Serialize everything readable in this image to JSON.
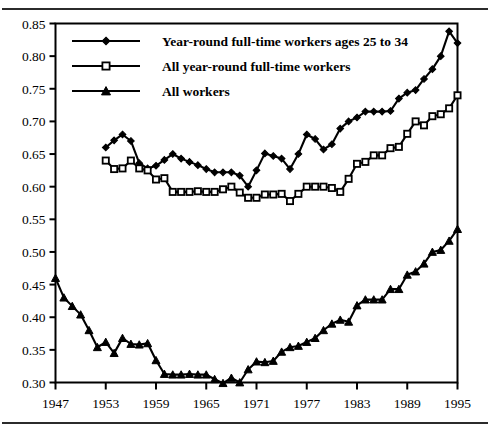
{
  "chart_data": {
    "type": "line",
    "title": "",
    "subtitle": "",
    "xlabel": "",
    "ylabel": "",
    "xlim": [
      1947,
      1995
    ],
    "ylim": [
      0.3,
      0.85
    ],
    "grid": false,
    "legend_position": "top-left-inside",
    "yticks": [
      "0.85",
      "0.80",
      "0.75",
      "0.70",
      "0.65",
      "0.60",
      "0.55",
      "0.50",
      "0.45",
      "0.40",
      "0.35",
      "0.30"
    ],
    "ytick_values": [
      0.85,
      0.8,
      0.75,
      0.7,
      0.65,
      0.6,
      0.55,
      0.5,
      0.45,
      0.4,
      0.35,
      0.3
    ],
    "xticks": [
      "1947",
      "1953",
      "1959",
      "1965",
      "1971",
      "1977",
      "1983",
      "1989",
      "1995"
    ],
    "xtick_values": [
      1947,
      1953,
      1959,
      1965,
      1971,
      1977,
      1983,
      1989,
      1995
    ],
    "series": [
      {
        "name": "Year-round full-time workers ages 25 to 34",
        "marker": "diamond",
        "color": "#000000",
        "x": [
          1953,
          1954,
          1955,
          1956,
          1957,
          1958,
          1959,
          1960,
          1961,
          1962,
          1963,
          1964,
          1965,
          1966,
          1967,
          1968,
          1969,
          1970,
          1971,
          1972,
          1973,
          1974,
          1975,
          1976,
          1977,
          1978,
          1979,
          1980,
          1981,
          1982,
          1983,
          1984,
          1985,
          1986,
          1987,
          1988,
          1989,
          1990,
          1991,
          1992,
          1993,
          1994,
          1995
        ],
        "values": [
          0.66,
          0.671,
          0.68,
          0.67,
          0.636,
          0.628,
          0.632,
          0.641,
          0.65,
          0.643,
          0.638,
          0.633,
          0.627,
          0.622,
          0.622,
          0.622,
          0.617,
          0.6,
          0.625,
          0.651,
          0.647,
          0.643,
          0.627,
          0.65,
          0.68,
          0.673,
          0.657,
          0.665,
          0.689,
          0.7,
          0.706,
          0.715,
          0.715,
          0.715,
          0.716,
          0.735,
          0.744,
          0.748,
          0.765,
          0.78,
          0.8,
          0.838,
          0.82
        ]
      },
      {
        "name": "All year-round full-time workers",
        "marker": "square-open",
        "color": "#000000",
        "x": [
          1953,
          1954,
          1955,
          1956,
          1957,
          1958,
          1959,
          1960,
          1961,
          1962,
          1963,
          1964,
          1965,
          1966,
          1967,
          1968,
          1969,
          1970,
          1971,
          1972,
          1973,
          1974,
          1975,
          1976,
          1977,
          1978,
          1979,
          1980,
          1981,
          1982,
          1983,
          1984,
          1985,
          1986,
          1987,
          1988,
          1989,
          1990,
          1991,
          1992,
          1993,
          1994,
          1995
        ],
        "values": [
          0.64,
          0.627,
          0.628,
          0.64,
          0.628,
          0.625,
          0.611,
          0.613,
          0.592,
          0.592,
          0.592,
          0.593,
          0.592,
          0.592,
          0.596,
          0.6,
          0.591,
          0.583,
          0.583,
          0.588,
          0.588,
          0.589,
          0.578,
          0.589,
          0.6,
          0.6,
          0.6,
          0.598,
          0.592,
          0.612,
          0.635,
          0.638,
          0.648,
          0.648,
          0.659,
          0.661,
          0.681,
          0.7,
          0.694,
          0.708,
          0.711,
          0.72,
          0.74
        ]
      },
      {
        "name": "All workers",
        "marker": "triangle",
        "color": "#000000",
        "x": [
          1947,
          1948,
          1949,
          1950,
          1951,
          1952,
          1953,
          1954,
          1955,
          1956,
          1957,
          1958,
          1959,
          1960,
          1961,
          1962,
          1963,
          1964,
          1965,
          1966,
          1967,
          1968,
          1969,
          1970,
          1971,
          1972,
          1973,
          1974,
          1975,
          1976,
          1977,
          1978,
          1979,
          1980,
          1981,
          1982,
          1983,
          1984,
          1985,
          1986,
          1987,
          1988,
          1989,
          1990,
          1991,
          1992,
          1993,
          1994,
          1995
        ],
        "values": [
          0.46,
          0.43,
          0.417,
          0.404,
          0.38,
          0.354,
          0.362,
          0.345,
          0.368,
          0.359,
          0.358,
          0.36,
          0.334,
          0.313,
          0.312,
          0.312,
          0.313,
          0.312,
          0.312,
          0.305,
          0.299,
          0.307,
          0.3,
          0.32,
          0.332,
          0.331,
          0.333,
          0.347,
          0.354,
          0.356,
          0.362,
          0.368,
          0.38,
          0.39,
          0.396,
          0.393,
          0.418,
          0.427,
          0.427,
          0.427,
          0.443,
          0.443,
          0.465,
          0.47,
          0.482,
          0.5,
          0.503,
          0.517,
          0.535
        ]
      }
    ]
  },
  "legend": {
    "items": [
      {
        "label": "Year-round full-time workers ages 25 to 34",
        "marker": "diamond"
      },
      {
        "label": "All year-round full-time workers",
        "marker": "square-open"
      },
      {
        "label": "All workers",
        "marker": "triangle"
      }
    ]
  },
  "style": {
    "axis_color": "#000000",
    "series_color": "#000000",
    "rule_color": "#2b2b2b",
    "background": "#ffffff"
  }
}
